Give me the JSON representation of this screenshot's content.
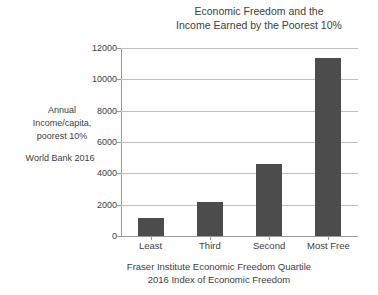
{
  "chart_data": {
    "type": "bar",
    "title": "Economic Freedom and the Income Earned by the Poorest 10%",
    "title_line1": "Economic Freedom and the",
    "title_line2": "Income Earned by the Poorest 10%",
    "categories": [
      "Least",
      "Third",
      "Second",
      "Most Free"
    ],
    "values": [
      1150,
      2150,
      4600,
      11350
    ],
    "series": [
      {
        "name": "Annual Income/capita, poorest 10%",
        "values": [
          1150,
          2150,
          4600,
          11350
        ]
      }
    ],
    "ylabel_line1": "Annual",
    "ylabel_line2": "Income/capita,",
    "ylabel_line3": "poorest 10%",
    "source_note": "World Bank 2016",
    "xlabel_line1": "Fraser Institute Economic Freedom Quartile",
    "xlabel_line2": "2016 Index of Economic Freedom",
    "xlabel": "Fraser Institute Economic Freedom Quartile / 2016 Index of Economic Freedom",
    "ylabel": "Annual Income/capita, poorest 10%",
    "ylim": [
      0,
      12000
    ],
    "ytick_labels": [
      "12000",
      "10000",
      "8000",
      "6000",
      "4000",
      "2000",
      "0"
    ],
    "ytick_values": [
      12000,
      10000,
      8000,
      6000,
      4000,
      2000,
      0
    ],
    "ytick_step": 2000,
    "grid": true,
    "legend": false,
    "bar_color": "#4c4c4c",
    "gridline_color": "#bfbfbf",
    "axis_color": "#9a9a9a",
    "text_color": "#404040",
    "background": "#ffffff"
  }
}
